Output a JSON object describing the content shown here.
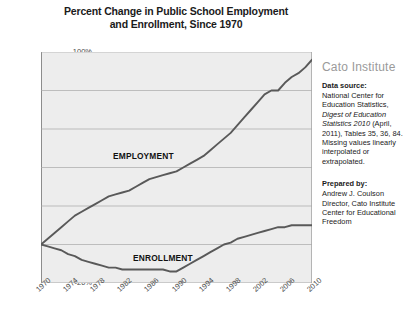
{
  "chart_data": {
    "type": "line",
    "title": "Percent Change in Public School Employment and Enrollment, Since 1970",
    "title_line1": "Percent Change in Public School Employment",
    "title_line2": "and Enrollment, Since 1970",
    "xlabel": "",
    "ylabel": "",
    "xlim": [
      1970,
      2010
    ],
    "ylim": [
      -20,
      100
    ],
    "ytick_labels": [
      "100%",
      "80%",
      "60%",
      "40%",
      "20%",
      "0%",
      "-20%"
    ],
    "ytick_values": [
      100,
      80,
      60,
      40,
      20,
      0,
      -20
    ],
    "xtick_labels": [
      "1970",
      "1974",
      "1978",
      "1982",
      "1986",
      "1990",
      "1994",
      "1998",
      "2002",
      "2006",
      "2010"
    ],
    "xtick_values": [
      1970,
      1974,
      1978,
      1982,
      1986,
      1990,
      1994,
      1998,
      2002,
      2006,
      2010
    ],
    "grid": true,
    "legend_position": "inline-annotation",
    "x": [
      1970,
      1971,
      1972,
      1973,
      1974,
      1975,
      1976,
      1977,
      1978,
      1979,
      1980,
      1981,
      1982,
      1983,
      1984,
      1985,
      1986,
      1987,
      1988,
      1989,
      1990,
      1991,
      1992,
      1993,
      1994,
      1995,
      1996,
      1997,
      1998,
      1999,
      2000,
      2001,
      2002,
      2003,
      2004,
      2005,
      2006,
      2007,
      2008,
      2009,
      2010
    ],
    "series": [
      {
        "name": "EMPLOYMENT",
        "color": "#595959",
        "label_x": 1985,
        "label_y": 46,
        "values": [
          0,
          3,
          6,
          9,
          12,
          15,
          17,
          19,
          21,
          23,
          25,
          26,
          27,
          28,
          30,
          32,
          34,
          35,
          36,
          37,
          38,
          40,
          42,
          44,
          46,
          49,
          52,
          55,
          58,
          62,
          66,
          70,
          74,
          78,
          80,
          80,
          84,
          87,
          89,
          92,
          96
        ]
      },
      {
        "name": "ENROLLMENT",
        "color": "#595959",
        "label_x": 1988,
        "label_y": -7,
        "values": [
          0,
          -1,
          -2,
          -3,
          -5,
          -6,
          -8,
          -9,
          -10,
          -11,
          -12,
          -12,
          -13,
          -13,
          -13,
          -13,
          -13,
          -13,
          -13,
          -14,
          -14,
          -12,
          -10,
          -8,
          -6,
          -4,
          -2,
          0,
          1,
          3,
          4,
          5,
          6,
          7,
          8,
          9,
          9,
          10,
          10,
          10,
          10
        ]
      }
    ]
  },
  "sidebar": {
    "brand": "Cato Institute",
    "data_source_heading": "Data source:",
    "data_source_line1": "National Center for",
    "data_source_line2": "Education Statistics,",
    "data_source_italic": "Digest of Education",
    "data_source_italic2": "Statistics 2010",
    "data_source_line3": " (April,",
    "data_source_line4": "2011), Tables 35, 36,",
    "data_source_line5": "84.  Missing values",
    "data_source_line6": "linearly interpolated or",
    "data_source_line7": "extrapolated.",
    "prepared_heading": "Prepared by:",
    "prepared_line1": "Andrew J. Coulson",
    "prepared_line2": "Director, Cato Institute",
    "prepared_line3": "Center for Educational",
    "prepared_line4": "Freedom"
  },
  "colors": {
    "plot_background": "#ededed",
    "gridline": "#a8a8a8",
    "line": "#595959",
    "brand_text": "#9a9a9a",
    "axis_text": "#4a4a4a"
  }
}
